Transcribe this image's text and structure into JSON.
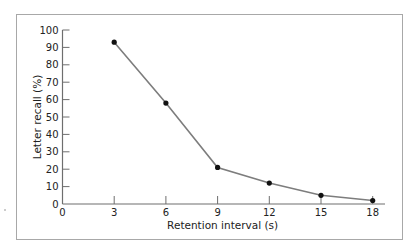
{
  "chart_data": {
    "type": "line",
    "title": "",
    "xlabel": "Retention interval (s)",
    "ylabel": "Letter recall (%)",
    "x": [
      3,
      6,
      9,
      12,
      15,
      18
    ],
    "series": [
      {
        "name": "Letter recall",
        "values": [
          93,
          58,
          21,
          12,
          5,
          2
        ]
      }
    ],
    "xlim": [
      0,
      19
    ],
    "ylim": [
      0,
      100
    ],
    "xticks": [
      0,
      3,
      6,
      9,
      12,
      15,
      18
    ],
    "yticks": [
      0,
      10,
      20,
      30,
      40,
      50,
      60,
      70,
      80,
      90,
      100
    ],
    "xtick_labels": [
      "0",
      "3",
      "6",
      "9",
      "12",
      "15",
      "18"
    ],
    "ytick_labels": [
      "0",
      "10",
      "20",
      "30",
      "40",
      "50",
      "60",
      "70",
      "80",
      "90",
      "100"
    ],
    "grid": false,
    "legend": "none",
    "colors": {
      "line": "#7d7d7d",
      "marker": "#111111",
      "axis": "#6e6e6e",
      "frame": "#a8a8a8"
    }
  }
}
